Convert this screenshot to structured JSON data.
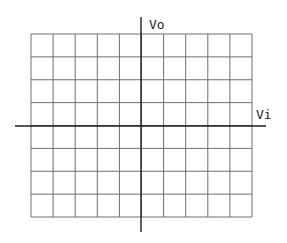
{
  "diagram": {
    "type": "oscilloscope-graticule",
    "grid": {
      "columns": 10,
      "rows": 8,
      "left": 31,
      "top": 34,
      "right": 252,
      "bottom": 217,
      "line_color": "#6e6e6e"
    },
    "axes": {
      "vertical": {
        "label": "Vo",
        "x": 141,
        "y_start": 17,
        "y_end": 232
      },
      "horizontal": {
        "label": "Vi",
        "y": 126,
        "x_start": 15,
        "x_end": 266
      },
      "color": "#1e1e1e"
    }
  }
}
